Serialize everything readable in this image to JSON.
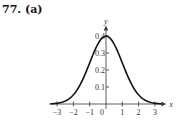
{
  "problem_label": "77. (a)",
  "chart_data": {
    "type": "line",
    "title": "",
    "xlabel": "x",
    "ylabel": "y",
    "xlim": [
      -3.5,
      3.7
    ],
    "ylim": [
      0,
      0.45
    ],
    "xticks": [
      -3,
      -2,
      -1,
      0,
      1,
      2,
      3
    ],
    "xtick_labels": [
      "−3",
      "−2",
      "−1",
      "0",
      "1",
      "2",
      "3"
    ],
    "yticks": [
      0.1,
      0.2,
      0.3,
      0.4
    ],
    "ytick_labels": [
      "0.1",
      "0.2",
      "0.3",
      "0.4"
    ],
    "grid": false,
    "series": [
      {
        "name": "standard normal density",
        "function": "y = (1/sqrt(2*pi)) * exp(-x^2/2)",
        "x_range": [
          -3.4,
          3.4
        ]
      }
    ]
  }
}
